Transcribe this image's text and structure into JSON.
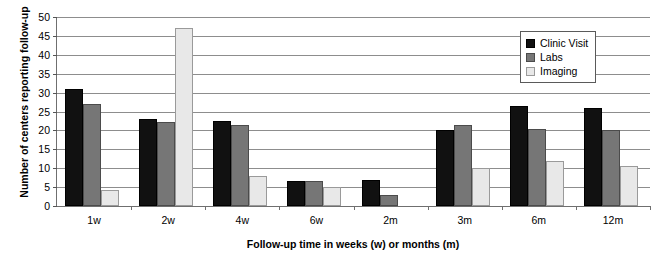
{
  "chart_data": {
    "type": "bar",
    "title": "",
    "xlabel": "Follow-up time in weeks (w) or months (m)",
    "ylabel": "Number of centers reporting follow-up",
    "categories": [
      "1w",
      "2w",
      "4w",
      "6w",
      "2m",
      "3m",
      "6m",
      "12m"
    ],
    "series": [
      {
        "name": "Clinic Visit",
        "color": "#111111",
        "values": [
          31,
          23,
          22.5,
          6.5,
          7,
          20,
          26.5,
          26
        ]
      },
      {
        "name": "Labs",
        "color": "#767676",
        "values": [
          27,
          22.3,
          21.5,
          6.5,
          3,
          21.5,
          20.5,
          20
        ]
      },
      {
        "name": "Imaging",
        "color": "#e8e8e8",
        "values": [
          4.3,
          47,
          8,
          5,
          0,
          10,
          12,
          10.5
        ]
      }
    ],
    "ylim": [
      0,
      50
    ],
    "ytick_step": 5,
    "yticks": [
      "0",
      "5",
      "10",
      "15",
      "20",
      "25",
      "30",
      "35",
      "40",
      "45",
      "50"
    ],
    "grid": true,
    "legend_position": "top-right"
  }
}
